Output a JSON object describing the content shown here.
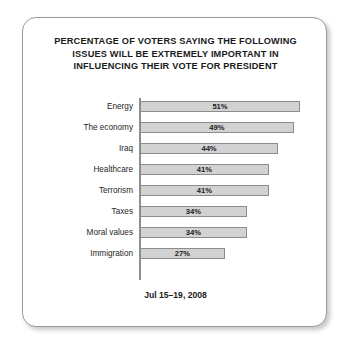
{
  "card": {
    "title_lines": [
      "PERCENTAGE OF VOTERS SAYING THE FOLLOWING",
      "ISSUES WILL BE EXTREMELY IMPORTANT IN",
      "INFLUENCING THEIR VOTE FOR PRESIDENT"
    ],
    "footer": "Jul 15–19, 2008"
  },
  "colors": {
    "bar_fill": "#d2d2d2",
    "bar_stroke": "#8c8c8c",
    "axis": "#8e8e8e",
    "card_border": "#9a9a9a",
    "text": "#1a1a1a"
  },
  "chart_data": {
    "type": "bar",
    "orientation": "horizontal",
    "title": "PERCENTAGE OF VOTERS SAYING THE FOLLOWING ISSUES WILL BE EXTREMELY IMPORTANT IN INFLUENCING THEIR VOTE FOR PRESIDENT",
    "subtitle": "Jul 15–19, 2008",
    "xlabel": "",
    "ylabel": "",
    "xlim": [
      0,
      51
    ],
    "grid": false,
    "legend": "none",
    "categories": [
      "Energy",
      "The economy",
      "Iraq",
      "Healthcare",
      "Terrorism",
      "Taxes",
      "Moral values",
      "Immigration"
    ],
    "values": [
      51,
      49,
      44,
      41,
      41,
      34,
      34,
      27
    ],
    "value_labels": [
      "51%",
      "49%",
      "44%",
      "41%",
      "41%",
      "34%",
      "34%",
      "27%"
    ],
    "bars": [
      {
        "label": "Energy",
        "value": 51,
        "value_label": "51%"
      },
      {
        "label": "The economy",
        "value": 49,
        "value_label": "49%"
      },
      {
        "label": "Iraq",
        "value": 44,
        "value_label": "44%"
      },
      {
        "label": "Healthcare",
        "value": 41,
        "value_label": "41%"
      },
      {
        "label": "Terrorism",
        "value": 41,
        "value_label": "41%"
      },
      {
        "label": "Taxes",
        "value": 34,
        "value_label": "34%"
      },
      {
        "label": "Moral values",
        "value": 34,
        "value_label": "34%"
      },
      {
        "label": "Immigration",
        "value": 27,
        "value_label": "27%"
      }
    ]
  }
}
